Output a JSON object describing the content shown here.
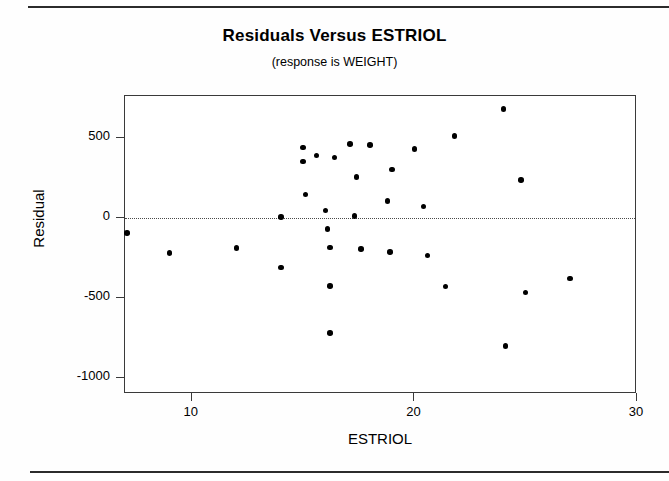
{
  "chart_data": {
    "type": "scatter",
    "title": "Residuals Versus ESTRIOL",
    "subtitle": "(response is WEIGHT)",
    "xlabel": "ESTRIOL",
    "ylabel": "Residual",
    "xlim": [
      7,
      30
    ],
    "ylim": [
      -1100,
      760
    ],
    "xticks": [
      10,
      20,
      30
    ],
    "yticks": [
      500,
      0,
      -500,
      -1000
    ],
    "xtick_labels": [
      "10",
      "20",
      "30"
    ],
    "ytick_labels": [
      "500",
      "0",
      "-500",
      "-1000"
    ],
    "grid": false,
    "legend": null,
    "reference_line": {
      "type": "horizontal",
      "y": 0,
      "style": "dotted"
    },
    "points": [
      {
        "x": 7.1,
        "y": -95
      },
      {
        "x": 9.0,
        "y": -220
      },
      {
        "x": 12.0,
        "y": -190
      },
      {
        "x": 14.0,
        "y": -310
      },
      {
        "x": 14.0,
        "y": 5
      },
      {
        "x": 15.0,
        "y": 440
      },
      {
        "x": 15.0,
        "y": 350
      },
      {
        "x": 15.1,
        "y": 145
      },
      {
        "x": 15.6,
        "y": 390
      },
      {
        "x": 16.0,
        "y": 45
      },
      {
        "x": 16.1,
        "y": -70
      },
      {
        "x": 16.2,
        "y": -185
      },
      {
        "x": 16.2,
        "y": -425
      },
      {
        "x": 16.2,
        "y": -720
      },
      {
        "x": 16.4,
        "y": 375
      },
      {
        "x": 17.1,
        "y": 460
      },
      {
        "x": 17.3,
        "y": 10
      },
      {
        "x": 17.4,
        "y": 255
      },
      {
        "x": 17.6,
        "y": -195
      },
      {
        "x": 18.0,
        "y": 455
      },
      {
        "x": 18.8,
        "y": 105
      },
      {
        "x": 18.9,
        "y": -215
      },
      {
        "x": 19.0,
        "y": 300
      },
      {
        "x": 20.0,
        "y": 430
      },
      {
        "x": 20.4,
        "y": 70
      },
      {
        "x": 20.6,
        "y": -235
      },
      {
        "x": 21.4,
        "y": -430
      },
      {
        "x": 21.8,
        "y": 510
      },
      {
        "x": 24.0,
        "y": 680
      },
      {
        "x": 24.1,
        "y": -800
      },
      {
        "x": 24.8,
        "y": 235
      },
      {
        "x": 25.0,
        "y": -465
      },
      {
        "x": 27.0,
        "y": -380
      }
    ]
  },
  "figure": {
    "top_rule": "horizontal-rule",
    "bottom_rule": "horizontal-rule"
  }
}
